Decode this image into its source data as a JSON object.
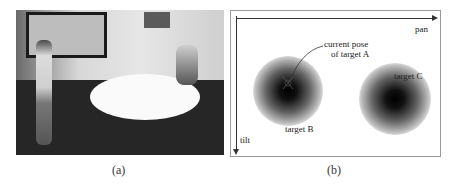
{
  "figure": {
    "panel_a": {
      "caption": "(a)",
      "description": "overhead camera view of a meeting room with people and a round table"
    },
    "panel_b": {
      "caption": "(b)",
      "axes": {
        "x_label": "pan",
        "y_label": "tilt"
      },
      "annotation": {
        "line1": "current pose",
        "line2": "of target A"
      },
      "targets": [
        {
          "label": "target B"
        },
        {
          "label": "target C"
        }
      ]
    }
  }
}
